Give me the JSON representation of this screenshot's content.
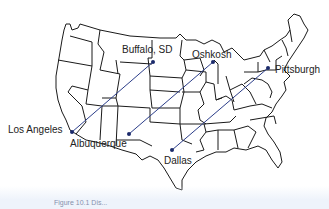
{
  "map": {
    "title": "Contiguous United States",
    "colors": {
      "border": "#1a1a1a",
      "route": "#2c3e8a",
      "dot": "#1b2a6b",
      "label": "#222222"
    },
    "routes": [
      {
        "from": "Buffalo, SD",
        "to": "Los Angeles"
      },
      {
        "from": "Oshkosh",
        "to": "Albuquerque"
      },
      {
        "from": "Pittsburgh",
        "to": "Dallas"
      }
    ],
    "cities": [
      {
        "name": "Buffalo, SD"
      },
      {
        "name": "Los Angeles"
      },
      {
        "name": "Oshkosh"
      },
      {
        "name": "Albuquerque"
      },
      {
        "name": "Pittsburgh"
      },
      {
        "name": "Dallas"
      }
    ]
  },
  "caption": {
    "text": "Figure 10.1 Dis..."
  }
}
